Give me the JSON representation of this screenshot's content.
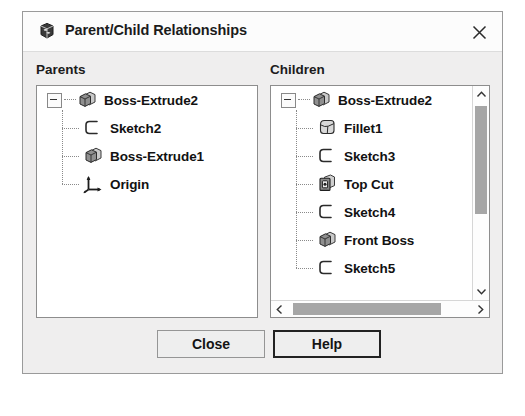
{
  "window": {
    "title": "Parent/Child Relationships",
    "icon": "solidworks-logo-icon",
    "close_icon": "close-icon"
  },
  "panels": {
    "parents": {
      "label": "Parents",
      "nodes": [
        {
          "label": "Boss-Extrude2",
          "icon": "extrude-feature-icon",
          "level": 0,
          "expanded": true
        },
        {
          "label": "Sketch2",
          "icon": "sketch-icon",
          "level": 1
        },
        {
          "label": "Boss-Extrude1",
          "icon": "extrude-feature-icon",
          "level": 1
        },
        {
          "label": "Origin",
          "icon": "origin-axes-icon",
          "level": 1
        }
      ]
    },
    "children": {
      "label": "Children",
      "nodes": [
        {
          "label": "Boss-Extrude2",
          "icon": "extrude-feature-icon",
          "level": 0,
          "expanded": true
        },
        {
          "label": "Fillet1",
          "icon": "fillet-icon",
          "level": 1
        },
        {
          "label": "Sketch3",
          "icon": "sketch-icon",
          "level": 1
        },
        {
          "label": "Top Cut",
          "icon": "cut-extrude-icon",
          "level": 1
        },
        {
          "label": "Sketch4",
          "icon": "sketch-icon",
          "level": 1
        },
        {
          "label": "Front Boss",
          "icon": "extrude-feature-icon",
          "level": 1
        },
        {
          "label": "Sketch5",
          "icon": "sketch-icon",
          "level": 1
        }
      ],
      "scroll": {
        "vertical_visible": true,
        "horizontal_visible": true,
        "up_arrow_icon": "chevron-up-icon",
        "down_arrow_icon": "chevron-down-icon",
        "left_arrow_icon": "chevron-left-icon",
        "right_arrow_icon": "chevron-right-icon"
      }
    }
  },
  "buttons": {
    "close": "Close",
    "help": "Help"
  },
  "colors": {
    "dialog_background": "#efeeee",
    "titlebar_background": "#fcfcfc",
    "panel_background": "#ffffff",
    "border": "#8d8d8d",
    "scroll_thumb": "#a6a6a6",
    "text": "#121212",
    "default_button_border": "#222222"
  }
}
